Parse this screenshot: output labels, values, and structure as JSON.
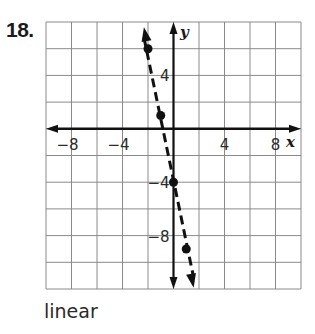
{
  "problem": {
    "number": "18.",
    "answer": "linear"
  },
  "chart_data": {
    "type": "scatter",
    "title": "",
    "xlabel": "x",
    "ylabel": "y",
    "xlim": [
      -10,
      10
    ],
    "ylim": [
      -12,
      8
    ],
    "grid": true,
    "grid_step": 2,
    "x_tick_labels": [
      "−8",
      "−4",
      "4",
      "8"
    ],
    "x_tick_values": [
      -8,
      -4,
      4,
      8
    ],
    "y_tick_labels": [
      "4",
      "−4",
      "−8"
    ],
    "y_tick_values": [
      4,
      -4,
      -8
    ],
    "series": [
      {
        "name": "points",
        "points": [
          [
            -2,
            6
          ],
          [
            -1,
            1
          ],
          [
            0,
            -4
          ],
          [
            1,
            -9
          ]
        ],
        "line_style": "dashed",
        "trend_equation": "y = -5x - 4"
      }
    ],
    "legend": null
  }
}
